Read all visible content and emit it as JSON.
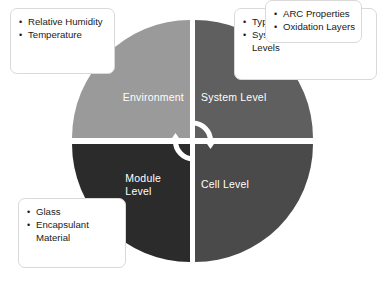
{
  "diagram": {
    "center_icon": "cycle-arrows-icon",
    "quadrants": [
      {
        "id": "environment",
        "label": "Environment",
        "color": "#9a9a9a",
        "position": "top-left"
      },
      {
        "id": "system-level",
        "label": "System Level",
        "color": "#5f5f5f",
        "position": "top-right"
      },
      {
        "id": "module-level",
        "label": "Module\nLevel",
        "color": "#2b2b2b",
        "position": "bottom-left"
      },
      {
        "id": "cell-level",
        "label": "Cell Level",
        "color": "#4a4a4a",
        "position": "bottom-right"
      }
    ],
    "callouts": [
      {
        "id": "environment-callout",
        "for": "environment",
        "position": "top-left",
        "items": [
          "Relative Humidity",
          "Temperature"
        ]
      },
      {
        "id": "system-level-callout",
        "for": "system-level",
        "position": "top-right",
        "items": [
          "Type of Grounding",
          "System Biasing Voltage Levels"
        ]
      },
      {
        "id": "module-level-callout",
        "for": "module-level",
        "position": "bottom-left",
        "items": [
          "Glass",
          "Encapsulant Material"
        ]
      },
      {
        "id": "cell-level-callout",
        "for": "cell-level",
        "position": "bottom-right",
        "items": [
          "ARC Properties",
          "Oxidation Layers"
        ]
      }
    ]
  }
}
